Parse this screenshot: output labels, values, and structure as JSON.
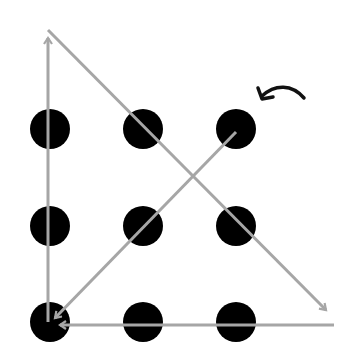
{
  "diagram": {
    "colors": {
      "background": "#ffffff",
      "dot": "#000000",
      "line": "#a6a6a6",
      "start_arrow": "#111111"
    },
    "dots": [
      {
        "row": 0,
        "col": 0,
        "cx": 50,
        "cy": 129
      },
      {
        "row": 0,
        "col": 1,
        "cx": 143,
        "cy": 129
      },
      {
        "row": 0,
        "col": 2,
        "cx": 236,
        "cy": 129
      },
      {
        "row": 1,
        "col": 0,
        "cx": 50,
        "cy": 226
      },
      {
        "row": 1,
        "col": 1,
        "cx": 143,
        "cy": 226
      },
      {
        "row": 1,
        "col": 2,
        "cx": 236,
        "cy": 226
      },
      {
        "row": 2,
        "col": 0,
        "cx": 50,
        "cy": 322
      },
      {
        "row": 2,
        "col": 1,
        "cx": 143,
        "cy": 322
      },
      {
        "row": 2,
        "col": 2,
        "cx": 236,
        "cy": 322
      }
    ],
    "segments": [
      {
        "order": 1,
        "from": [
          236,
          132
        ],
        "to": [
          55,
          318
        ],
        "direction": "down-left"
      },
      {
        "order": 2,
        "from": [
          48,
          322
        ],
        "to": [
          48,
          38
        ],
        "direction": "up"
      },
      {
        "order": 3,
        "from": [
          48,
          30
        ],
        "to": [
          326,
          310
        ],
        "direction": "down-right"
      },
      {
        "order": 4,
        "from": [
          334,
          325
        ],
        "to": [
          60,
          325
        ],
        "direction": "left"
      }
    ],
    "start_marker": {
      "icon": "curved-arrow-icon",
      "points_to": "top-right-dot"
    }
  }
}
